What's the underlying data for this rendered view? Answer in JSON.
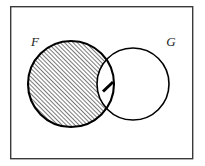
{
  "figure": {
    "background_color": "#ffffff",
    "stroke_color": "#000000",
    "frame": {
      "name": "outer-border",
      "x": 10,
      "y": 6,
      "width": 183,
      "height": 153,
      "stroke_width": 1.4,
      "color": "#333333",
      "fill": "#ffffff"
    },
    "sets": [
      {
        "id": "F",
        "label": "F",
        "label_x": 35,
        "label_y": 45,
        "circle": {
          "cx": 71,
          "cy": 84,
          "r": 43
        },
        "shaded": true,
        "shade_style": "diagonal-hatch",
        "stroke_width": 2.0
      },
      {
        "id": "G",
        "label": "G",
        "label_x": 171,
        "label_y": 45,
        "circle": {
          "cx": 133,
          "cy": 84,
          "r": 36
        },
        "shaded": false,
        "shade_style": "none",
        "stroke_width": 1.6
      }
    ],
    "annotations": [
      {
        "id": "lens-tick",
        "name": "intersection-tick-mark",
        "text": "1",
        "x1": 103,
        "y1": 91,
        "x2": 113,
        "y2": 82,
        "stroke_width": 3.0,
        "description": "short thick diagonal stroke inside the lens (intersection) region"
      }
    ],
    "hatch": {
      "angle_deg": 45,
      "spacing_px": 3,
      "line_width": 0.9,
      "color": "#000000"
    },
    "shaded_region_meaning": "F minus G (the part of F outside G)"
  }
}
